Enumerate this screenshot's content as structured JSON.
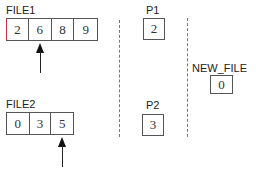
{
  "file1": {
    "label": "FILE1",
    "cells": [
      "2",
      "6",
      "8",
      "9"
    ],
    "pointer_index": 1
  },
  "file2": {
    "label": "FILE2",
    "cells": [
      "0",
      "3",
      "5"
    ],
    "pointer_index": 2
  },
  "p1": {
    "label": "P1",
    "value": "2"
  },
  "p2": {
    "label": "P2",
    "value": "3"
  },
  "new_file": {
    "label": "NEW_FILE",
    "cells": [
      "0"
    ]
  },
  "colors": {
    "border": "#555555",
    "text": "#222222",
    "dash": "#777777",
    "arrow": "#111111"
  }
}
